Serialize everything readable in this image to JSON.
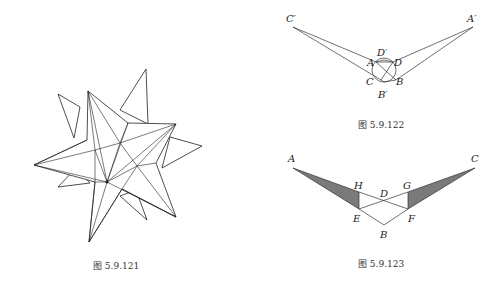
{
  "figures": [
    {
      "id": "fig121",
      "caption": "图 5.9.121",
      "description": "small stellated dodecahedron-like star polyhedron wireframe"
    },
    {
      "id": "fig122",
      "caption": "图 5.9.122",
      "labels": {
        "C_prime": "C′",
        "A_prime": "A′",
        "D_prime": "D′",
        "A": "A",
        "D": "D",
        "C": "C",
        "B": "B",
        "B_prime": "B′"
      }
    },
    {
      "id": "fig123",
      "caption": "图 5.9.123",
      "labels": {
        "A": "A",
        "C": "C",
        "H": "H",
        "D": "D",
        "G": "G",
        "E": "E",
        "F": "F",
        "B": "B"
      },
      "fill_color": "#7a7a7a"
    }
  ]
}
